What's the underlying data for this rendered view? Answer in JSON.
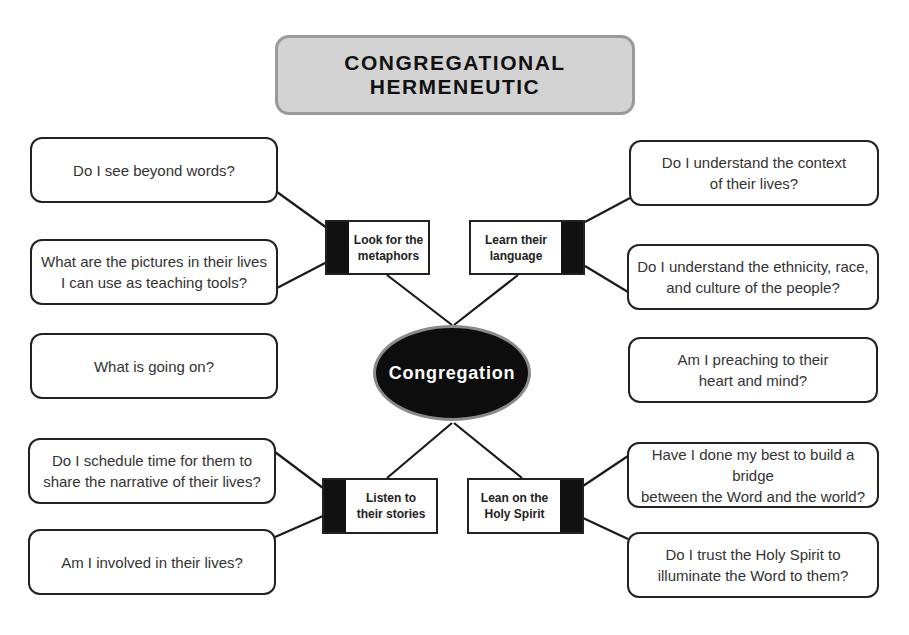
{
  "title": "CONGREGATIONAL\nHERMENEUTIC",
  "hub": {
    "label": "Congregation",
    "fill": "#0d0d0d",
    "border": "#8a8a8a",
    "text_color": "#ffffff"
  },
  "branches": [
    {
      "id": "metaphors",
      "label": "Look for the\nmetaphors",
      "bar_side": "left"
    },
    {
      "id": "language",
      "label": "Learn their\nlanguage",
      "bar_side": "right"
    },
    {
      "id": "stories",
      "label": "Listen to\ntheir stories",
      "bar_side": "left"
    },
    {
      "id": "spirit",
      "label": "Lean on the\nHoly Spirit",
      "bar_side": "right"
    }
  ],
  "questions": {
    "left": [
      {
        "text": "Do I see beyond words?",
        "branch": "metaphors"
      },
      {
        "text": "What are the pictures in their lives\nI can use as teaching tools?",
        "branch": "metaphors"
      },
      {
        "text": "What is going on?",
        "branch": null
      },
      {
        "text": "Do I schedule time for them to\nshare the narrative of their lives?",
        "branch": "stories"
      },
      {
        "text": "Am I involved in their lives?",
        "branch": "stories"
      }
    ],
    "right": [
      {
        "text": "Do I understand the context\nof their lives?",
        "branch": "language"
      },
      {
        "text": "Do I understand the ethnicity, race,\nand culture of the people?",
        "branch": "language"
      },
      {
        "text": "Am I preaching to their\nheart and mind?",
        "branch": null
      },
      {
        "text": "Have I done my best to build a bridge\nbetween the Word and the world?",
        "branch": "spirit"
      },
      {
        "text": "Do I trust the Holy Spirit to\nilluminate the Word to them?",
        "branch": "spirit"
      }
    ]
  },
  "colors": {
    "title_fill": "#d3d3d3",
    "title_border": "#9a9a9a",
    "stroke": "#222222",
    "bar": "#111111"
  }
}
